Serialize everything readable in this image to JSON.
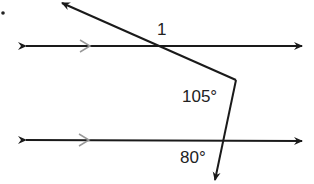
{
  "figure": {
    "angle_1_label": "1",
    "angle_105_label": "105°",
    "angle_80_label": "80°",
    "line_color": "#1a1a1a",
    "parallel_mark_color": "#999999"
  }
}
